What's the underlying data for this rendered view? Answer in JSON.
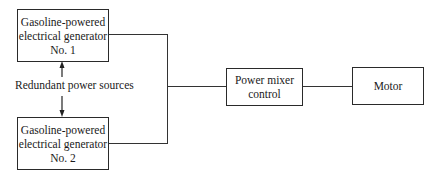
{
  "diagram": {
    "nodes": [
      {
        "id": "gen1",
        "lines": [
          "Gasoline-powered",
          "electrical generator",
          "No. 1"
        ]
      },
      {
        "id": "gen2",
        "lines": [
          "Gasoline-powered",
          "electrical generator",
          "No. 2"
        ]
      },
      {
        "id": "mixer",
        "lines": [
          "Power mixer",
          "control"
        ]
      },
      {
        "id": "motor",
        "lines": [
          "Motor"
        ]
      }
    ],
    "annotation": "Redundant power sources",
    "edges": [
      {
        "from": "gen1",
        "to": "mixer"
      },
      {
        "from": "gen2",
        "to": "mixer"
      },
      {
        "from": "mixer",
        "to": "motor"
      }
    ]
  }
}
